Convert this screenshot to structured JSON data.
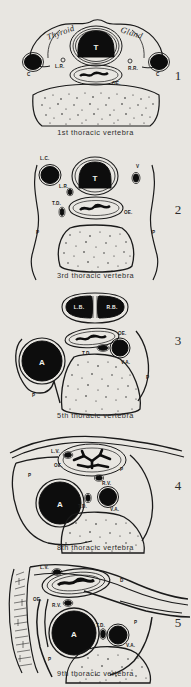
{
  "plate": {
    "title": "Cross sections of the thorax at successive thoracic vertebral levels",
    "background_color": "#e8e6e1",
    "ink_color": "#0d0d0d"
  },
  "panels": [
    {
      "number": "1",
      "caption": "1st thoracic vertebra",
      "script_labels": [
        {
          "text": "Thyroid"
        },
        {
          "text": "Gland"
        }
      ],
      "labels": [
        {
          "text": "T"
        },
        {
          "text": "C"
        },
        {
          "text": "L.R."
        },
        {
          "text": "R.R."
        },
        {
          "text": "C"
        },
        {
          "text": "OE."
        }
      ]
    },
    {
      "number": "2",
      "caption": "3rd thoracic vertebra",
      "script_labels": [],
      "labels": [
        {
          "text": "L.C."
        },
        {
          "text": "T"
        },
        {
          "text": "V"
        },
        {
          "text": "L.R."
        },
        {
          "text": "T.D."
        },
        {
          "text": "OE."
        },
        {
          "text": "P"
        },
        {
          "text": "P"
        }
      ]
    },
    {
      "number": "3",
      "caption": "5th thoracic vertebra",
      "script_labels": [],
      "labels": [
        {
          "text": "L.B."
        },
        {
          "text": "R.B."
        },
        {
          "text": "OE."
        },
        {
          "text": "A"
        },
        {
          "text": "T.D."
        },
        {
          "text": "V.A."
        },
        {
          "text": "P"
        },
        {
          "text": "P"
        }
      ]
    },
    {
      "number": "4",
      "caption": "8th thoracic vertebra",
      "script_labels": [],
      "labels": [
        {
          "text": "L.V."
        },
        {
          "text": "OE."
        },
        {
          "text": "P"
        },
        {
          "text": "P"
        },
        {
          "text": "A"
        },
        {
          "text": "R.V."
        },
        {
          "text": "T.D."
        },
        {
          "text": "V.A."
        }
      ]
    },
    {
      "number": "5",
      "caption": "9th thoracic vertebra",
      "script_labels": [],
      "labels": [
        {
          "text": "L.V."
        },
        {
          "text": "D"
        },
        {
          "text": "OE."
        },
        {
          "text": "R.V."
        },
        {
          "text": "A"
        },
        {
          "text": "T.D."
        },
        {
          "text": "P"
        },
        {
          "text": "V.A."
        },
        {
          "text": "P"
        }
      ]
    }
  ]
}
